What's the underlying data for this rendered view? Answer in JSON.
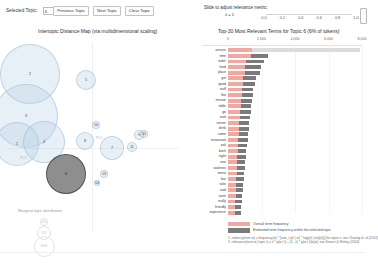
{
  "toolbar": {
    "selected_topic_label": "Selected Topic:",
    "selected_topic_value": "6",
    "previous_topic": "Previous Topic",
    "next_topic": "Next Topic",
    "clear_topic": "Clear Topic"
  },
  "slider": {
    "title": "Slide to adjust relevance metric:",
    "lambda_label": "λ = 1",
    "ticks": [
      "0.0",
      "0.2",
      "0.4",
      "0.6",
      "0.8",
      "1.0"
    ],
    "value": 1
  },
  "mds": {
    "title": "Intertopic Distance Map (via multidimensional scaling)",
    "axis_x_label": "PC1",
    "axis_y_label": "PC2",
    "legend_title": "Marginal topic distribution",
    "size_legend": [
      "2%",
      "5%",
      "10%"
    ]
  },
  "bars": {
    "title": "Top-30 Most Relevant Terms for Topic 6 (6% of tokens)",
    "legend_overall": "Overall term frequency",
    "legend_topic": "Estimated term frequency within the selected topic",
    "footnote_line1": "1. saliency(term w) = frequency(w) * [sum_t p(t | w) * log(p(t | w)/p(t))] for topics t; see Chuang et. al (2012)",
    "footnote_line2": "2. relevance(term w | topic t) = λ * p(w | t) + (1 - λ) * p(w | t)/p(w); see Sievert & Shirley (2014)"
  },
  "chart_data": {
    "type": "bar",
    "title": "Top-30 Most Relevant Terms for Topic 6 (6% of tokens)",
    "xlabel": "",
    "ylabel": "",
    "xlim": [
      0,
      8000
    ],
    "xticks": [
      0,
      2000,
      4000,
      6000,
      8000
    ],
    "xtick_labels": [
      "0",
      "2,000",
      "4,000",
      "6,000",
      "8,000"
    ],
    "grid": false,
    "legend_position": "bottom",
    "orientation": "horizontal",
    "categories": [
      "service",
      "time",
      "order",
      "food",
      "place",
      "get",
      "good",
      "staff",
      "like",
      "minute",
      "table",
      "go",
      "wait",
      "server",
      "drink",
      "come",
      "restaurant",
      "ask",
      "back",
      "night",
      "one",
      "waitress",
      "menu",
      "bar",
      "take",
      "said",
      "even",
      "really",
      "friendly",
      "experience"
    ],
    "series": [
      {
        "name": "Overall term frequency",
        "values": [
          7900,
          2400,
          2150,
          1950,
          1900,
          1650,
          1600,
          1520,
          1470,
          1430,
          1390,
          1350,
          1310,
          1280,
          1250,
          1210,
          1170,
          1140,
          1100,
          1060,
          1030,
          1000,
          970,
          940,
          910,
          880,
          850,
          820,
          800,
          780
        ]
      },
      {
        "name": "Estimated term frequency within the selected topic",
        "values": [
          1450,
          1380,
          1100,
          1040,
          1020,
          900,
          890,
          850,
          810,
          780,
          750,
          720,
          700,
          680,
          660,
          640,
          620,
          600,
          580,
          560,
          545,
          530,
          515,
          500,
          485,
          470,
          455,
          440,
          425,
          410
        ]
      }
    ],
    "highlighted_row_index": 0
  },
  "topics": [
    {
      "id": "2",
      "x": 30,
      "y": 38,
      "r": 30
    },
    {
      "id": "3",
      "x": 26,
      "y": 80,
      "r": 32
    },
    {
      "id": "1",
      "x": 17,
      "y": 108,
      "r": 22
    },
    {
      "id": "4",
      "x": 44,
      "y": 106,
      "r": 21
    },
    {
      "id": "5",
      "x": 86,
      "y": 44,
      "r": 10
    },
    {
      "id": "8",
      "x": 85,
      "y": 105,
      "r": 9
    },
    {
      "id": "10",
      "x": 96,
      "y": 89,
      "r": 4
    },
    {
      "id": "7",
      "x": 112,
      "y": 112,
      "r": 12
    },
    {
      "id": "11",
      "x": 132,
      "y": 111,
      "r": 5
    },
    {
      "id": "9",
      "x": 139,
      "y": 99,
      "r": 5
    },
    {
      "id": "12",
      "x": 144,
      "y": 98,
      "r": 4
    },
    {
      "id": "13",
      "x": 104,
      "y": 138,
      "r": 4
    },
    {
      "id": "6",
      "x": 66,
      "y": 138,
      "r": 20,
      "selected": true
    },
    {
      "id": "14",
      "x": 97,
      "y": 147,
      "r": 3
    }
  ]
}
